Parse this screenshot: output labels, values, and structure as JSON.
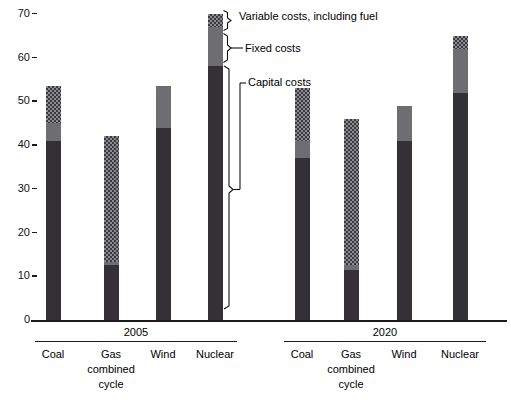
{
  "chart_data": {
    "type": "bar",
    "title": "",
    "subtitle": "",
    "xlabel": "",
    "ylabel": "",
    "ylim": [
      0,
      70
    ],
    "ytick_values": [
      0,
      10,
      20,
      30,
      40,
      50,
      60,
      70
    ],
    "ytick_labels": [
      "0",
      "10",
      "20",
      "30",
      "40",
      "50",
      "60",
      "70"
    ],
    "grid": false,
    "legend_position": "annotated-callouts-on-nuclear-2005-bar",
    "stacked": true,
    "group_labels": [
      "2005",
      "2020"
    ],
    "categories": [
      "Coal",
      "Gas combined cycle",
      "Wind",
      "Nuclear"
    ],
    "series": [
      {
        "name": "Capital costs",
        "color": "#333136",
        "values_2005": [
          41.0,
          12.5,
          44.0,
          58.0
        ],
        "values_2020": [
          37.0,
          11.5,
          41.0,
          52.0
        ]
      },
      {
        "name": "Fixed costs",
        "color": "#6e6e72",
        "values_2005": [
          4.0,
          0.8,
          9.5,
          9.0
        ],
        "values_2020": [
          4.0,
          1.0,
          8.0,
          10.0
        ]
      },
      {
        "name": "Variable costs, including fuel",
        "color": "#8d8d91",
        "values_2005": [
          8.5,
          28.7,
          0.0,
          3.0
        ],
        "values_2020": [
          12.0,
          33.5,
          0.0,
          3.0
        ]
      }
    ],
    "totals_2005": [
      53.5,
      42.0,
      53.5,
      70.0
    ],
    "totals_2020": [
      53.0,
      46.0,
      49.0,
      65.0
    ],
    "annotations": [
      "Variable costs, including fuel",
      "Fixed costs",
      "Capital costs"
    ]
  },
  "axis": {
    "ticks": [
      {
        "label": "70",
        "value": 70
      },
      {
        "label": "60",
        "value": 60
      },
      {
        "label": "50",
        "value": 50
      },
      {
        "label": "40",
        "value": 40
      },
      {
        "label": "30",
        "value": 30
      },
      {
        "label": "20",
        "value": 20
      },
      {
        "label": "10",
        "value": 10
      },
      {
        "label": "0",
        "value": 0
      }
    ]
  },
  "groups": [
    {
      "label": "2005",
      "bars": [
        {
          "category": "Coal",
          "line1": "Coal",
          "line2": "",
          "line3": "",
          "capital": 41.0,
          "fixed": 4.0,
          "variable": 8.5,
          "total": 53.5
        },
        {
          "category": "Gas combined cycle",
          "line1": "Gas",
          "line2": "combined",
          "line3": "cycle",
          "capital": 12.5,
          "fixed": 0.8,
          "variable": 28.7,
          "total": 42.0
        },
        {
          "category": "Wind",
          "line1": "Wind",
          "line2": "",
          "line3": "",
          "capital": 44.0,
          "fixed": 9.5,
          "variable": 0.0,
          "total": 53.5
        },
        {
          "category": "Nuclear",
          "line1": "Nuclear",
          "line2": "",
          "line3": "",
          "capital": 58.0,
          "fixed": 9.0,
          "variable": 3.0,
          "total": 70.0
        }
      ]
    },
    {
      "label": "2020",
      "bars": [
        {
          "category": "Coal",
          "line1": "Coal",
          "line2": "",
          "line3": "",
          "capital": 37.0,
          "fixed": 4.0,
          "variable": 12.0,
          "total": 53.0
        },
        {
          "category": "Gas combined cycle",
          "line1": "Gas",
          "line2": "combined",
          "line3": "cycle",
          "capital": 11.5,
          "fixed": 1.0,
          "variable": 33.5,
          "total": 46.0
        },
        {
          "category": "Wind",
          "line1": "Wind",
          "line2": "",
          "line3": "",
          "capital": 41.0,
          "fixed": 8.0,
          "variable": 0.0,
          "total": 49.0
        },
        {
          "category": "Nuclear",
          "line1": "Nuclear",
          "line2": "",
          "line3": "",
          "capital": 52.0,
          "fixed": 10.0,
          "variable": 3.0,
          "total": 65.0
        }
      ]
    }
  ],
  "callouts": {
    "variable": "Variable costs, including fuel",
    "fixed": "Fixed costs",
    "capital": "Capital costs"
  },
  "colors": {
    "capital": "#333136",
    "fixed": "#6e6e72",
    "variable": "#8d8d91",
    "axis": "#1a1a1a",
    "background": "#ffffff"
  }
}
